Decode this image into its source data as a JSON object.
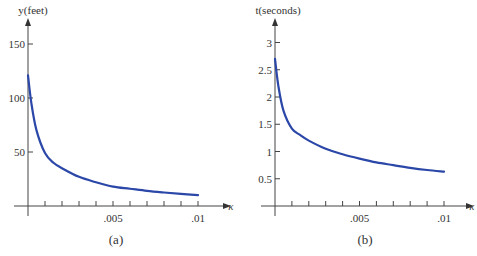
{
  "chart_data": [
    {
      "type": "line",
      "panel_label": "(a)",
      "title": "",
      "xlabel": "κ",
      "ylabel": "y(feet)",
      "xlim": [
        0,
        0.0105
      ],
      "ylim": [
        0,
        165
      ],
      "grid": false,
      "x_ticks": [
        0.001,
        0.002,
        0.003,
        0.004,
        0.005,
        0.006,
        0.007,
        0.008,
        0.009,
        0.01
      ],
      "x_tick_labels": [
        {
          "value": 0.005,
          "label": ".005"
        },
        {
          "value": 0.01,
          "label": ".01"
        }
      ],
      "y_ticks": [
        {
          "value": 50,
          "label": "50"
        },
        {
          "value": 100,
          "label": "100"
        },
        {
          "value": 150,
          "label": "150"
        }
      ],
      "series": [
        {
          "name": "y(κ)",
          "color": "#2b47a8",
          "x": [
            0,
            0.0002,
            0.0005,
            0.001,
            0.0015,
            0.002,
            0.003,
            0.004,
            0.005,
            0.006,
            0.007,
            0.008,
            0.009,
            0.01
          ],
          "y": [
            121,
            95,
            70,
            49,
            40,
            35,
            27,
            22,
            18,
            16,
            14,
            12.5,
            11.2,
            10
          ]
        }
      ]
    },
    {
      "type": "line",
      "panel_label": "(b)",
      "title": "",
      "xlabel": "κ",
      "ylabel": "t(seconds)",
      "xlim": [
        0,
        0.0105
      ],
      "ylim": [
        0,
        3.3
      ],
      "grid": false,
      "x_ticks": [
        0.001,
        0.002,
        0.003,
        0.004,
        0.005,
        0.006,
        0.007,
        0.008,
        0.009,
        0.01
      ],
      "x_tick_labels": [
        {
          "value": 0.005,
          "label": ".005"
        },
        {
          "value": 0.01,
          "label": ".01"
        }
      ],
      "y_ticks": [
        {
          "value": 0.5,
          "label": "0.5"
        },
        {
          "value": 1,
          "label": "1"
        },
        {
          "value": 1.5,
          "label": "1.5"
        },
        {
          "value": 2,
          "label": "2"
        },
        {
          "value": 2.5,
          "label": "2.5"
        },
        {
          "value": 3,
          "label": "3"
        }
      ],
      "series": [
        {
          "name": "t(κ)",
          "color": "#2b47a8",
          "x": [
            0,
            0.0002,
            0.0005,
            0.001,
            0.0015,
            0.002,
            0.003,
            0.004,
            0.005,
            0.006,
            0.007,
            0.008,
            0.009,
            0.01
          ],
          "y": [
            2.7,
            2.2,
            1.75,
            1.42,
            1.3,
            1.2,
            1.05,
            0.95,
            0.87,
            0.8,
            0.75,
            0.7,
            0.66,
            0.63
          ]
        }
      ]
    }
  ]
}
